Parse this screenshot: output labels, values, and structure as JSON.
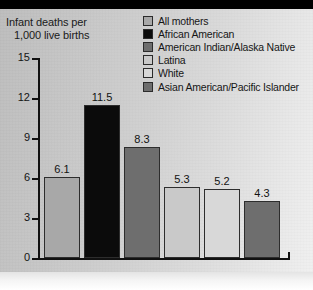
{
  "chart_data": {
    "type": "bar",
    "title": "",
    "xlabel": "",
    "ylabel": "Infant deaths per 1,000 live births",
    "ylabel_line1": "Infant deaths per",
    "ylabel_line2": "1,000 live births",
    "categories": [
      "All mothers",
      "African American",
      "American Indian/Alaska Native",
      "Latina",
      "White",
      "Asian American/Pacific Islander"
    ],
    "values": [
      6.1,
      11.5,
      8.3,
      5.3,
      5.2,
      4.3
    ],
    "value_labels": [
      "6.1",
      "11.5",
      "8.3",
      "5.3",
      "5.2",
      "4.3"
    ],
    "colors": [
      "#a8a8a8",
      "#0b0b0b",
      "#6e6e6e",
      "#c9c9c9",
      "#d8d8d8",
      "#6e6e6e"
    ],
    "ylim": [
      0,
      15
    ],
    "yticks": [
      0,
      3,
      6,
      9,
      12,
      15
    ],
    "ytick_labels": [
      "0",
      "3",
      "6",
      "9",
      "12",
      "15"
    ],
    "grid": false,
    "legend_position": "top-right"
  },
  "legend": {
    "items": [
      {
        "label": "All mothers",
        "color": "#a8a8a8"
      },
      {
        "label": "African American",
        "color": "#0b0b0b"
      },
      {
        "label": "American Indian/Alaska Native",
        "color": "#6e6e6e"
      },
      {
        "label": "Latina",
        "color": "#c9c9c9"
      },
      {
        "label": "White",
        "color": "#d8d8d8"
      },
      {
        "label": "Asian American/Pacific Islander",
        "color": "#6e6e6e"
      }
    ]
  }
}
